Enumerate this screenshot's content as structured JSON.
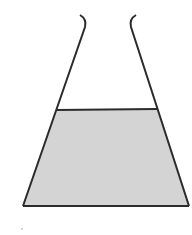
{
  "diagram": {
    "colors": {
      "outline": "#2b2b2b",
      "liquid": "#d4d4d4",
      "background": "#ffffff"
    },
    "flask": {
      "lip_left": [
        [
          80,
          15
        ],
        [
          84,
          18
        ],
        [
          86,
          22
        ],
        [
          85,
          27
        ]
      ],
      "lip_right": [
        [
          136,
          15
        ],
        [
          132,
          18
        ],
        [
          130,
          22
        ],
        [
          131,
          27
        ]
      ],
      "left_wall": [
        [
          85,
          27
        ],
        [
          23,
          206
        ]
      ],
      "right_wall": [
        [
          131,
          27
        ],
        [
          189,
          206
        ]
      ],
      "base": [
        [
          23,
          206
        ],
        [
          189,
          206
        ]
      ]
    },
    "liquid": {
      "surface": [
        [
          56,
          110
        ],
        [
          157,
          109
        ]
      ],
      "polygon": [
        [
          56,
          110
        ],
        [
          157,
          109
        ],
        [
          189,
          206
        ],
        [
          23,
          206
        ]
      ]
    }
  }
}
